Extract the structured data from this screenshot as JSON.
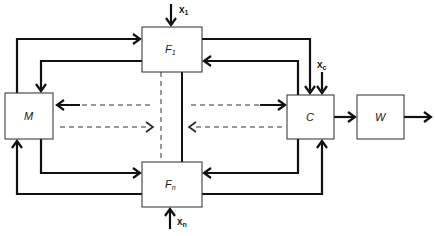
{
  "diagram": {
    "type": "block-diagram",
    "blocks": {
      "F1": {
        "label": "F",
        "subscript": "1"
      },
      "Fn": {
        "label": "F",
        "subscript": "n"
      },
      "M": {
        "label": "M"
      },
      "C": {
        "label": "C"
      },
      "W": {
        "label": "W"
      }
    },
    "inputs": {
      "x1": {
        "label": "x",
        "subscript": "1"
      },
      "xn": {
        "label": "x",
        "subscript": "n"
      },
      "xc": {
        "label": "x",
        "subscript": "c"
      }
    },
    "connections": [
      {
        "from": "M",
        "to": "F1",
        "style": "solid"
      },
      {
        "from": "F1",
        "to": "M",
        "style": "solid"
      },
      {
        "from": "F1",
        "to": "C",
        "style": "solid"
      },
      {
        "from": "C",
        "to": "F1",
        "style": "solid"
      },
      {
        "from": "M",
        "to": "Fn",
        "style": "solid"
      },
      {
        "from": "Fn",
        "to": "M",
        "style": "solid"
      },
      {
        "from": "Fn",
        "to": "C",
        "style": "solid"
      },
      {
        "from": "C",
        "to": "Fn",
        "style": "solid"
      },
      {
        "from": "C",
        "to": "W",
        "style": "solid"
      },
      {
        "from": "W",
        "to": "output",
        "style": "solid"
      },
      {
        "from": "F-bus",
        "to": "M",
        "style": "dashed"
      },
      {
        "from": "M",
        "to": "F-bus",
        "style": "dashed"
      },
      {
        "from": "F-bus",
        "to": "C",
        "style": "dashed"
      },
      {
        "from": "C",
        "to": "F-bus",
        "style": "dashed"
      },
      {
        "from": "F1",
        "to": "Fn",
        "style": "solid-link"
      },
      {
        "from": "F1",
        "to": "Fn",
        "style": "dashed-link"
      }
    ]
  }
}
